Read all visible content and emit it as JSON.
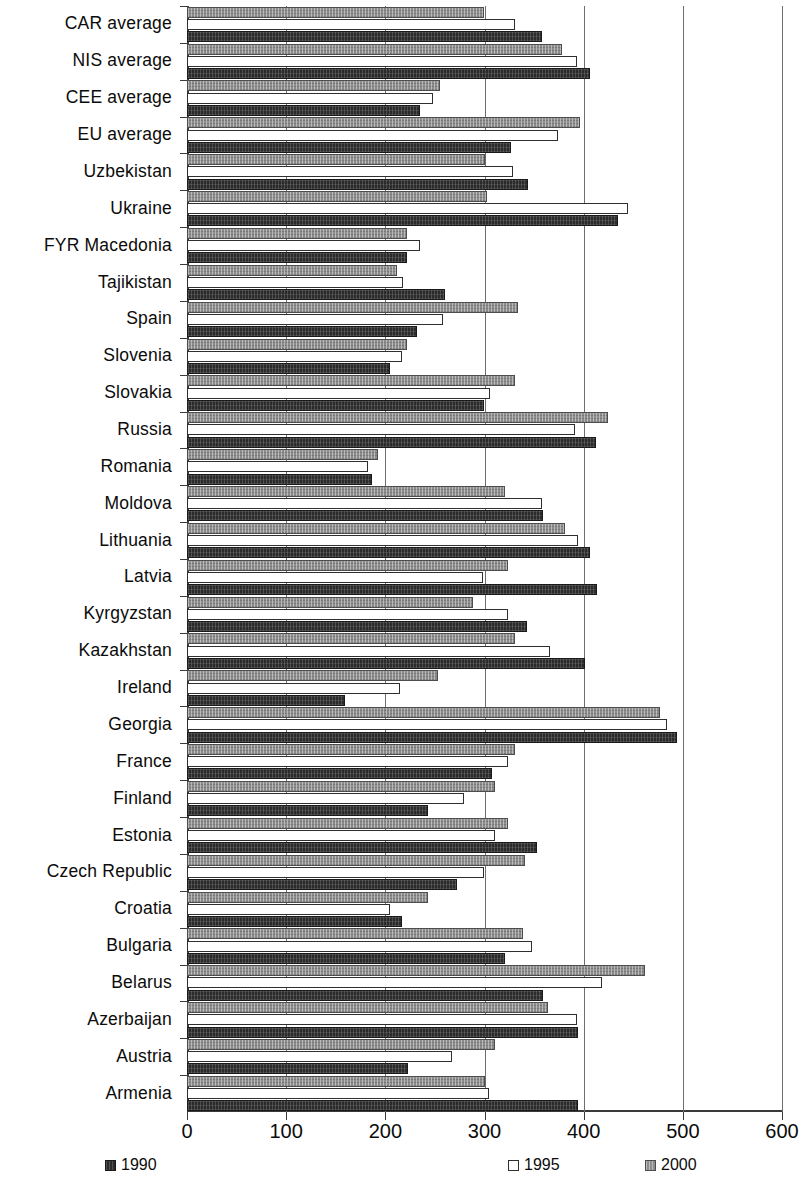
{
  "chart_data": {
    "type": "bar",
    "orientation": "horizontal",
    "title": "",
    "subtitle": "",
    "xlabel": "",
    "ylabel": "",
    "xlim": [
      0,
      600
    ],
    "xticks": [
      0,
      100,
      200,
      300,
      400,
      500,
      600
    ],
    "xtick_labels": [
      "0",
      "100",
      "200",
      "300",
      "400",
      "500",
      "600"
    ],
    "grid": true,
    "grid_axis": "x",
    "legend_position": "bottom",
    "categories": [
      "CAR average",
      "NIS average",
      "CEE average",
      "EU average",
      "Uzbekistan",
      "Ukraine",
      "FYR Macedonia",
      "Tajikistan",
      "Spain",
      "Slovenia",
      "Slovakia",
      "Russia",
      "Romania",
      "Moldova",
      "Lithuania",
      "Latvia",
      "Kyrgyzstan",
      "Kazakhstan",
      "Ireland",
      "Georgia",
      "France",
      "Finland",
      "Estonia",
      "Czech Republic",
      "Croatia",
      "Bulgaria",
      "Belarus",
      "Azerbaijan",
      "Austria",
      "Armenia"
    ],
    "series": [
      {
        "name": "1990",
        "color": "#2b2b2b",
        "values": [
          358,
          406,
          235,
          327,
          344,
          435,
          222,
          260,
          232,
          205,
          299,
          412,
          187,
          359,
          406,
          413,
          343,
          401,
          159,
          494,
          308,
          243,
          353,
          272,
          217,
          321,
          359,
          394,
          223,
          394
        ]
      },
      {
        "name": "1995",
        "color": "#ffffff",
        "values": [
          331,
          393,
          248,
          374,
          329,
          445,
          235,
          218,
          258,
          217,
          306,
          391,
          183,
          358,
          394,
          298,
          324,
          366,
          215,
          484,
          324,
          279,
          311,
          299,
          205,
          348,
          418,
          393,
          267,
          305
        ]
      },
      {
        "name": "2000",
        "color": "#8d8d8d",
        "values": [
          299,
          378,
          255,
          396,
          300,
          303,
          222,
          212,
          334,
          222,
          331,
          425,
          193,
          321,
          381,
          324,
          288,
          331,
          253,
          477,
          331,
          311,
          324,
          341,
          243,
          339,
          462,
          364,
          311,
          300
        ]
      }
    ]
  },
  "legend": {
    "items": [
      {
        "label": "1990",
        "swatch": "y1990"
      },
      {
        "label": "1995",
        "swatch": "y1995"
      },
      {
        "label": "2000",
        "swatch": "y2000"
      }
    ]
  }
}
